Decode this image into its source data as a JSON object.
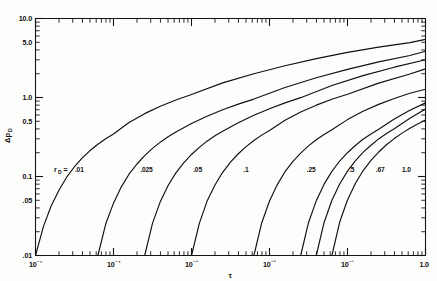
{
  "chart_data": {
    "type": "line",
    "title": "",
    "xlabel": "τ",
    "ylabel": "Δp_D",
    "xscale": "log",
    "yscale": "log",
    "xlim": [
      1e-05,
      1.0
    ],
    "ylim": [
      0.01,
      10.0
    ],
    "grid": false,
    "legend_position": "inline-curve-labels",
    "x_tick_labels": [
      "10⁻⁵",
      "10⁻⁴",
      "10⁻³",
      "10⁻²",
      "10⁻¹",
      "1.0"
    ],
    "x_tick_values": [
      1e-05,
      0.0001,
      0.001,
      0.01,
      0.1,
      1.0
    ],
    "y_tick_labels": [
      "10.0",
      "5.0",
      "1.0",
      "0.5",
      "0.1",
      ".05",
      ".01"
    ],
    "y_tick_values": [
      10.0,
      5.0,
      1.0,
      0.5,
      0.1,
      0.05,
      0.01
    ],
    "series_parameter_name": "r_D",
    "series_parameter_symbol": "r",
    "series_parameter_subscript": "D",
    "series_parameter_equals": "=",
    "series": [
      {
        "name": ".01",
        "label": ".01",
        "rD": 0.01,
        "label_x": 3.2e-05,
        "label_y": 0.115,
        "x": [
          1e-05,
          1.26e-05,
          1.58e-05,
          2e-05,
          2.51e-05,
          3.16e-05,
          3.98e-05,
          5.01e-05,
          6.31e-05,
          7.94e-05,
          0.0001,
          0.000158,
          0.000251,
          0.000398,
          0.000631,
          0.001,
          0.00251,
          0.00631,
          0.0158,
          0.0398,
          0.1,
          0.251,
          0.631,
          1.0
        ],
        "y": [
          0.01,
          0.023,
          0.042,
          0.067,
          0.098,
          0.133,
          0.172,
          0.213,
          0.256,
          0.3,
          0.345,
          0.482,
          0.625,
          0.775,
          0.93,
          1.09,
          1.53,
          2.0,
          2.52,
          3.1,
          3.72,
          4.35,
          4.95,
          5.45
        ],
        "y_at_right_edge": 5.45
      },
      {
        "name": ".025",
        "label": ".025",
        "rD": 0.025,
        "label_x": 0.00022,
        "label_y": 0.115,
        "x": [
          6.31e-05,
          7.94e-05,
          0.0001,
          0.000126,
          0.000158,
          0.0002,
          0.000251,
          0.000316,
          0.000398,
          0.000501,
          0.000631,
          0.001,
          0.00158,
          0.00251,
          0.00398,
          0.00631,
          0.0158,
          0.0398,
          0.1,
          0.251,
          0.631,
          1.0
        ],
        "y": [
          0.01,
          0.025,
          0.046,
          0.074,
          0.107,
          0.144,
          0.184,
          0.227,
          0.272,
          0.318,
          0.366,
          0.468,
          0.58,
          0.7,
          0.825,
          0.955,
          1.34,
          1.78,
          2.27,
          2.82,
          3.4,
          3.85
        ],
        "y_at_right_edge": 3.85
      },
      {
        "name": ".05",
        "label": ".05",
        "rD": 0.05,
        "label_x": 0.00105,
        "label_y": 0.115,
        "x": [
          0.000251,
          0.000316,
          0.000398,
          0.000501,
          0.000631,
          0.000794,
          0.001,
          0.00126,
          0.00158,
          0.002,
          0.00251,
          0.00398,
          0.00631,
          0.01,
          0.0158,
          0.0251,
          0.0631,
          0.158,
          0.398,
          1.0
        ],
        "y": [
          0.01,
          0.0255,
          0.048,
          0.077,
          0.111,
          0.149,
          0.19,
          0.234,
          0.28,
          0.327,
          0.375,
          0.48,
          0.597,
          0.722,
          0.855,
          0.995,
          1.42,
          1.89,
          2.42,
          3.0
        ],
        "y_at_right_edge": 3.0
      },
      {
        "name": ".1",
        "label": ".1",
        "rD": 0.1,
        "label_x": 0.0046,
        "label_y": 0.115,
        "x": [
          0.001,
          0.00126,
          0.00158,
          0.002,
          0.00251,
          0.00316,
          0.00398,
          0.00501,
          0.00631,
          0.00794,
          0.01,
          0.0158,
          0.0251,
          0.0398,
          0.0631,
          0.1,
          0.251,
          0.631,
          1.0
        ],
        "y": [
          0.01,
          0.0255,
          0.0485,
          0.078,
          0.113,
          0.152,
          0.194,
          0.239,
          0.286,
          0.334,
          0.383,
          0.515,
          0.655,
          0.8,
          0.95,
          1.1,
          1.52,
          1.98,
          2.3
        ],
        "y_at_right_edge": 2.3
      },
      {
        "name": ".25",
        "label": ".25",
        "rD": 0.25,
        "label_x": 0.03,
        "label_y": 0.115,
        "x": [
          0.00631,
          0.00794,
          0.01,
          0.0126,
          0.0158,
          0.02,
          0.0251,
          0.0316,
          0.0398,
          0.0501,
          0.0631,
          0.1,
          0.158,
          0.251,
          0.398,
          0.631,
          1.0
        ],
        "y": [
          0.01,
          0.0258,
          0.049,
          0.079,
          0.115,
          0.155,
          0.198,
          0.244,
          0.292,
          0.341,
          0.391,
          0.525,
          0.668,
          0.818,
          0.972,
          1.13,
          1.27
        ],
        "y_at_right_edge": 1.27
      },
      {
        "name": ".5",
        "label": ".5",
        "rD": 0.5,
        "label_x": 0.105,
        "label_y": 0.115,
        "x": [
          0.0251,
          0.0316,
          0.0398,
          0.0501,
          0.0631,
          0.0794,
          0.1,
          0.126,
          0.158,
          0.2,
          0.251,
          0.398,
          0.631,
          1.0
        ],
        "y": [
          0.01,
          0.026,
          0.0495,
          0.08,
          0.116,
          0.157,
          0.2,
          0.247,
          0.296,
          0.346,
          0.397,
          0.535,
          0.69,
          0.855
        ],
        "y_at_right_edge": 0.855
      },
      {
        "name": ".67",
        "label": ".67",
        "rD": 0.67,
        "label_x": 0.23,
        "label_y": 0.115,
        "x": [
          0.0398,
          0.0501,
          0.0631,
          0.0794,
          0.1,
          0.126,
          0.158,
          0.2,
          0.251,
          0.316,
          0.398,
          0.631,
          1.0
        ],
        "y": [
          0.01,
          0.0262,
          0.05,
          0.0805,
          0.117,
          0.158,
          0.202,
          0.249,
          0.299,
          0.35,
          0.402,
          0.545,
          0.715
        ],
        "y_at_right_edge": 0.715
      },
      {
        "name": "1.0",
        "label": "1.0",
        "rD": 1.0,
        "label_x": 0.5,
        "label_y": 0.115,
        "x": [
          0.0631,
          0.0794,
          0.1,
          0.126,
          0.158,
          0.2,
          0.251,
          0.316,
          0.398,
          0.501,
          0.631,
          0.794,
          1.0
        ],
        "y": [
          0.01,
          0.0265,
          0.0505,
          0.0815,
          0.118,
          0.16,
          0.204,
          0.252,
          0.302,
          0.354,
          0.407,
          0.462,
          0.52
        ],
        "y_at_right_edge": 0.52
      }
    ]
  },
  "figure": {
    "background_color": "#fdfdfc",
    "line_color": "#101010",
    "axis_color": "#141414"
  }
}
